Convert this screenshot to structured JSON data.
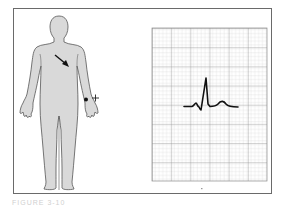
{
  "figure": {
    "caption": "FIGURE 3-10",
    "left_panel": {
      "subject": "human-body-anterior-view",
      "electrode": {
        "location": "left wrist",
        "polarity_label": "+"
      },
      "arrow": {
        "direction": "down-right",
        "meaning": "direction of cardiac electrical axis"
      }
    },
    "right_panel": {
      "subject": "ecg-strip",
      "grid": {
        "small_square_px": 3.8,
        "major_every": 5
      },
      "waveform": [
        "P wave",
        "Q",
        "R (tall upright)",
        "S",
        "T wave"
      ]
    },
    "colors": {
      "frame": "#6a6a6a",
      "body_fill": "#d9d9d9",
      "body_outline": "#555555",
      "grid_minor": "#c8c8c8",
      "grid_major": "#8a8a8a",
      "trace": "#111111"
    }
  }
}
